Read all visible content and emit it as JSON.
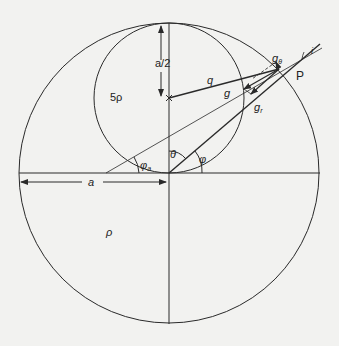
{
  "diagram": {
    "labels": {
      "half_a": "a/2",
      "inner_density": "5ρ",
      "outer_density": "ρ",
      "q": "q",
      "g": "g",
      "g_r": "g",
      "g_r_sub": "r",
      "g_theta": "g",
      "g_theta_sub": "θ",
      "point": "P",
      "i": "i",
      "a": "a",
      "phi_a": "φ",
      "phi_a_sub": "a",
      "theta": "θ",
      "phi": "φ"
    },
    "colors": {
      "background": "#f2f2f0",
      "stroke": "#2a2a2a"
    }
  }
}
